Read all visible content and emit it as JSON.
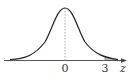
{
  "diagram": {
    "type": "normal-distribution-curve",
    "axis_label": "z",
    "tick_labels": [
      "0",
      "3"
    ],
    "shaded_region": "z > 3",
    "colors": {
      "curve": "#222222",
      "axis": "#444444",
      "center_line": "#999999",
      "shade": "#bbbbbb"
    }
  }
}
